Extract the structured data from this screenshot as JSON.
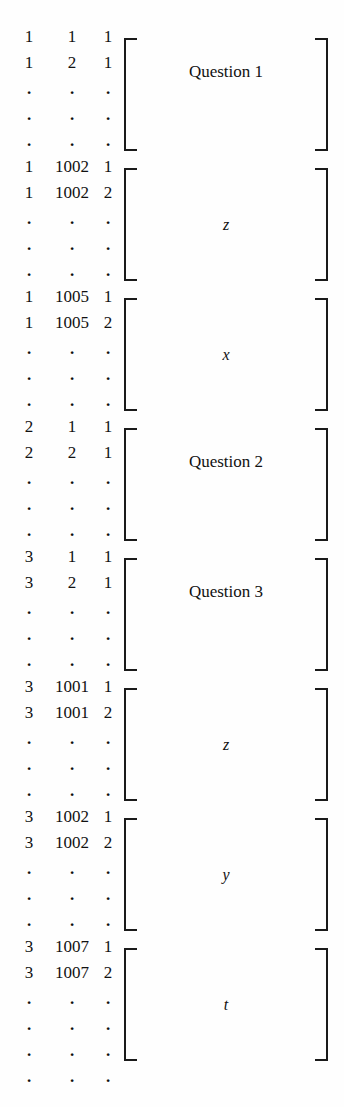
{
  "figure": {
    "kind": "matrix-index-block-diagram",
    "background_color": "#fefefe",
    "ink_color": "#1a1a1a",
    "continuation_dot": "."
  },
  "blocks": [
    {
      "label": "Question 1",
      "label_style": "upright",
      "rows": [
        {
          "c1": "1",
          "c2": "1",
          "c3": "1"
        },
        {
          "c1": "1",
          "c2": "2",
          "c3": "1"
        },
        {
          "c1": ".",
          "c2": ".",
          "c3": "."
        },
        {
          "c1": ".",
          "c2": ".",
          "c3": "."
        },
        {
          "c1": ".",
          "c2": ".",
          "c3": "."
        }
      ]
    },
    {
      "label": "z",
      "label_style": "italic",
      "rows": [
        {
          "c1": "1",
          "c2": "1002",
          "c3": "1"
        },
        {
          "c1": "1",
          "c2": "1002",
          "c3": "2"
        },
        {
          "c1": ".",
          "c2": ".",
          "c3": "."
        },
        {
          "c1": ".",
          "c2": ".",
          "c3": "."
        },
        {
          "c1": ".",
          "c2": ".",
          "c3": "."
        }
      ]
    },
    {
      "label": "x",
      "label_style": "italic",
      "rows": [
        {
          "c1": "1",
          "c2": "1005",
          "c3": "1"
        },
        {
          "c1": "1",
          "c2": "1005",
          "c3": "2"
        },
        {
          "c1": ".",
          "c2": ".",
          "c3": "."
        },
        {
          "c1": ".",
          "c2": ".",
          "c3": "."
        },
        {
          "c1": ".",
          "c2": ".",
          "c3": "."
        }
      ]
    },
    {
      "label": "Question 2",
      "label_style": "upright",
      "rows": [
        {
          "c1": "2",
          "c2": "1",
          "c3": "1"
        },
        {
          "c1": "2",
          "c2": "2",
          "c3": "1"
        },
        {
          "c1": ".",
          "c2": ".",
          "c3": "."
        },
        {
          "c1": ".",
          "c2": ".",
          "c3": "."
        },
        {
          "c1": ".",
          "c2": ".",
          "c3": "."
        }
      ]
    },
    {
      "label": "Question 3",
      "label_style": "upright",
      "rows": [
        {
          "c1": "3",
          "c2": "1",
          "c3": "1"
        },
        {
          "c1": "3",
          "c2": "2",
          "c3": "1"
        },
        {
          "c1": ".",
          "c2": ".",
          "c3": "."
        },
        {
          "c1": ".",
          "c2": ".",
          "c3": "."
        },
        {
          "c1": ".",
          "c2": ".",
          "c3": "."
        }
      ]
    },
    {
      "label": "z",
      "label_style": "italic",
      "rows": [
        {
          "c1": "3",
          "c2": "1001",
          "c3": "1"
        },
        {
          "c1": "3",
          "c2": "1001",
          "c3": "2"
        },
        {
          "c1": ".",
          "c2": ".",
          "c3": "."
        },
        {
          "c1": ".",
          "c2": ".",
          "c3": "."
        },
        {
          "c1": ".",
          "c2": ".",
          "c3": "."
        }
      ]
    },
    {
      "label": "y",
      "label_style": "italic",
      "rows": [
        {
          "c1": "3",
          "c2": "1002",
          "c3": "1"
        },
        {
          "c1": "3",
          "c2": "1002",
          "c3": "2"
        },
        {
          "c1": ".",
          "c2": ".",
          "c3": "."
        },
        {
          "c1": ".",
          "c2": ".",
          "c3": "."
        },
        {
          "c1": ".",
          "c2": ".",
          "c3": "."
        }
      ]
    },
    {
      "label": "t",
      "label_style": "italic",
      "rows": [
        {
          "c1": "3",
          "c2": "1007",
          "c3": "1"
        },
        {
          "c1": "3",
          "c2": "1007",
          "c3": "2"
        },
        {
          "c1": ".",
          "c2": ".",
          "c3": "."
        },
        {
          "c1": ".",
          "c2": ".",
          "c3": "."
        },
        {
          "c1": ".",
          "c2": ".",
          "c3": "."
        }
      ]
    }
  ],
  "trailing_row": {
    "c1": ".",
    "c2": ".",
    "c3": "."
  }
}
